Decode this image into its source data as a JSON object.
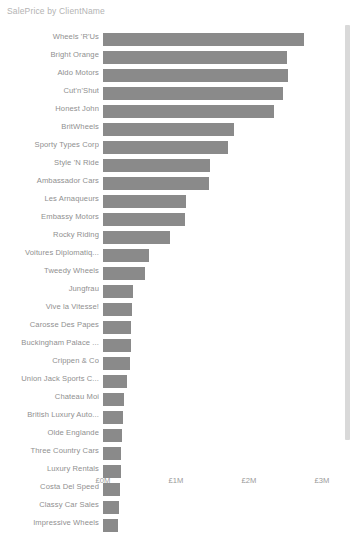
{
  "chart": {
    "title": "SalePrice by ClientName"
  },
  "axis": {
    "ticks": [
      {
        "label": "£0M",
        "value": 0
      },
      {
        "label": "£1M",
        "value": 1000000
      },
      {
        "label": "£2M",
        "value": 2000000
      },
      {
        "label": "£3M",
        "value": 3000000
      }
    ]
  },
  "scrollbar": {
    "name": "vertical-scrollbar",
    "color": "#d9d9d9"
  },
  "chart_data": {
    "type": "bar",
    "orientation": "horizontal",
    "title": "SalePrice by ClientName",
    "xlabel": "",
    "ylabel": "",
    "xlim": [
      0,
      3000000
    ],
    "grid": false,
    "legend": false,
    "bar_color": "#8a8a8a",
    "xtick_labels": [
      "£0M",
      "£1M",
      "£2M",
      "£3M"
    ],
    "xtick_values": [
      0,
      1000000,
      2000000,
      3000000
    ],
    "categories": [
      "Wheels 'R'Us",
      "Bright Orange",
      "Aldo Motors",
      "Cut'n'Shut",
      "Honest John",
      "BritWheels",
      "Sporty Types Corp",
      "Style 'N Ride",
      "Ambassador Cars",
      "Les Arnaqueurs",
      "Embassy Motors",
      "Rocky Riding",
      "Voitures Diplomatiq...",
      "Tweedy Wheels",
      "Jungfrau",
      "Vive la Vitesse!",
      "Carosse Des Papes",
      "Buckingham Palace ...",
      "Crippen & Co",
      "Union Jack Sports C...",
      "Chateau Moi",
      "British Luxury Auto...",
      "Olde Englande",
      "Three Country Cars",
      "Luxury Rentals",
      "Costa Del Speed",
      "Classy Car Sales",
      "Impressive Wheels"
    ],
    "values": [
      2750000,
      2520000,
      2530000,
      2470000,
      2340000,
      1800000,
      1710000,
      1470000,
      1450000,
      1140000,
      1130000,
      920000,
      630000,
      580000,
      410000,
      400000,
      390000,
      380000,
      370000,
      330000,
      290000,
      280000,
      260000,
      250000,
      240000,
      230000,
      220000,
      210000
    ]
  }
}
